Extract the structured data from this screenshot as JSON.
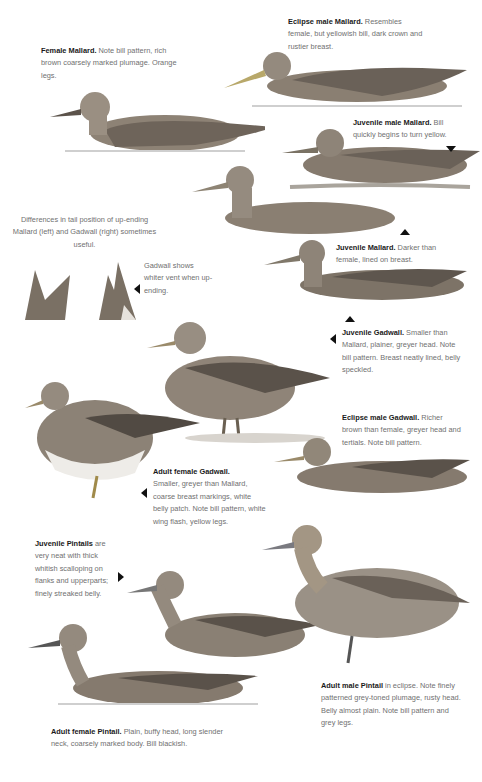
{
  "captions": {
    "female_mallard": {
      "title": "Female Mallard.",
      "text": " Note bill pattern, rich brown coarsely marked plumage. Orange legs."
    },
    "eclipse_male_mallard": {
      "title": "Eclipse male Mallard.",
      "text": " Resembles female, but yellowish bill, dark crown and rustier breast."
    },
    "juvenile_male_mallard": {
      "title": "Juvenile male Mallard.",
      "text": " Bill quickly begins to turn yellow."
    },
    "upending_note": {
      "text": "Differences in tail position of up-ending Mallard (left) and Gadwall (right) sometimes useful."
    },
    "gadwall_vent": {
      "text": "Gadwall shows whiter vent when up-ending."
    },
    "juvenile_mallard": {
      "title": "Juvenile Mallard.",
      "text": " Darker than female, lined on breast."
    },
    "juvenile_gadwall": {
      "title": "Juvenile Gadwall.",
      "text": " Smaller than Mallard, plainer, greyer head. Note bill pattern. Breast neatly lined, belly speckled."
    },
    "eclipse_male_gadwall": {
      "title": "Eclipse male Gadwall.",
      "text": " Richer brown than female, greyer head and tertials. Note bill pattern."
    },
    "adult_female_gadwall": {
      "title": "Adult female Gadwall.",
      "text": " Smaller, greyer than Mallard, coarse breast markings, white belly patch. Note bill pattern, white wing flash, yellow legs."
    },
    "juvenile_pintails": {
      "title": "Juvenile Pintails",
      "text": " are very neat with thick whitish scalloping on flanks and upperparts; finely streaked belly."
    },
    "adult_male_pintail": {
      "title": "Adult male Pintail",
      "text": " in eclipse. Note finely patterned grey-toned plumage, rusty head. Belly almost plain. Note bill pattern and grey legs."
    },
    "adult_female_pintail": {
      "title": "Adult female Pintail.",
      "text": " Plain, buffy head, long slender neck, coarsely marked body. Bill blackish."
    }
  },
  "colors": {
    "title_text": "#1a1a1a",
    "body_text": "#707070",
    "ink": "#2b2b2b",
    "plumage": "#8a7f72",
    "water": "#cfcfcf"
  }
}
